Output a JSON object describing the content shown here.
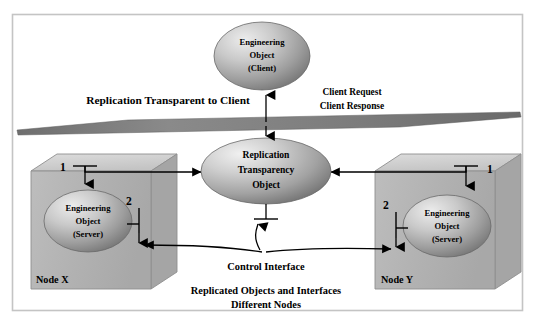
{
  "diagram": {
    "title_caption": {
      "line1": "Replicated Objects and Interfaces",
      "line2": "Different Nodes"
    },
    "banner_label": "Replication Transparent to Client",
    "client_object": {
      "line1": "Engineering",
      "line2": "Object",
      "line3": "(Client)"
    },
    "center_object": {
      "line1": "Replication",
      "line2": "Transparency",
      "line3": "Object"
    },
    "request_labels": {
      "request": "Client Request",
      "response": "Client Response"
    },
    "control_interface_label": "Control Interface",
    "nodes": [
      {
        "name": "Node X",
        "object": {
          "line1": "Engineering",
          "line2": "Object",
          "line3": "(Server)"
        },
        "interface_1": "1",
        "interface_2": "2"
      },
      {
        "name": "Node Y",
        "object": {
          "line1": "Engineering",
          "line2": "Object",
          "line3": "(Server)"
        },
        "interface_1": "1",
        "interface_2": "2"
      }
    ],
    "colors": {
      "frame_border": "#c8c8c8",
      "background": "#ffffff",
      "plane_fill": "#808080",
      "node_front": "#b4b4b4",
      "node_top": "#d2d2d2",
      "node_side": "#9a9a9a",
      "ellipse_light": "#e2e2e2",
      "ellipse_dark": "#7a7a7a",
      "line": "#000000"
    }
  }
}
